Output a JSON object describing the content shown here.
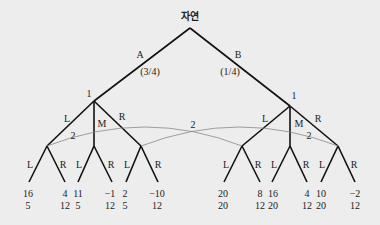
{
  "root": {
    "label": "자연"
  },
  "nature_moves": [
    {
      "label": "A",
      "prob": "(3/4)"
    },
    {
      "label": "B",
      "prob": "(1/4)"
    }
  ],
  "player1_nodes": [
    {
      "label": "1"
    },
    {
      "label": "1"
    }
  ],
  "player1_moves": [
    "L",
    "M",
    "R"
  ],
  "info_set_labels": [
    "2",
    "2",
    "2"
  ],
  "player2_moves": [
    "L",
    "R"
  ],
  "payoffs": [
    {
      "p1": "16",
      "p2": "5"
    },
    {
      "p1": "4",
      "p2": "12"
    },
    {
      "p1": "11",
      "p2": "5"
    },
    {
      "p1": "−1",
      "p2": "12"
    },
    {
      "p1": "2",
      "p2": "5"
    },
    {
      "p1": "−10",
      "p2": "12"
    },
    {
      "p1": "20",
      "p2": "20"
    },
    {
      "p1": "8",
      "p2": "12"
    },
    {
      "p1": "16",
      "p2": "20"
    },
    {
      "p1": "4",
      "p2": "12"
    },
    {
      "p1": "10",
      "p2": "20"
    },
    {
      "p1": "−2",
      "p2": "12"
    }
  ]
}
